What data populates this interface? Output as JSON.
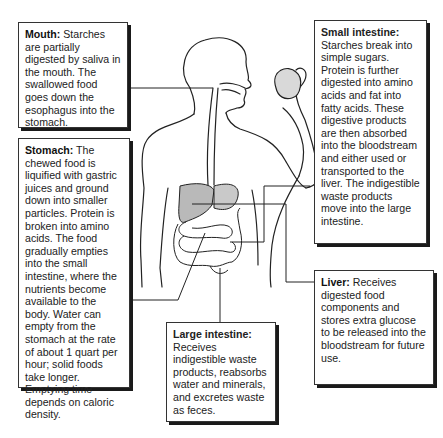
{
  "diagram": {
    "organ_fill_color": "#b9b9b9",
    "line_color": "#222222"
  },
  "callouts": {
    "mouth": {
      "title": "Mouth:",
      "text": " Starches are partially digested by saliva in the mouth. The swallowed food goes down the esophagus into the stomach."
    },
    "stomach": {
      "title": "Stomach:",
      "text": " The chewed food is liquified with gastric juices and ground down into smaller particles. Protein is broken into amino acids. The food gradually empties into the small intestine, where the nutrients become available to the body. Water can empty from the stomach at the rate of about 1 quart per hour; solid foods take longer. Emptying time depends on caloric density."
    },
    "small_intestine": {
      "title": "Small intestine:",
      "text": "Starches break into simple sugars. Protein is further digested into amino acids and fat into fatty acids. These digestive products are then absorbed into the bloodstream and either used or transported to the liver. The indigestible waste products move into the large intestine."
    },
    "liver": {
      "title": "Liver:",
      "text": " Receives digested food components and stores extra glucose to be released into the bloodstream for future use."
    },
    "large_intestine": {
      "title": "Large intestine:",
      "text": "Receives indigestible waste products, reabsorbs water and minerals, and excretes waste as feces."
    }
  }
}
